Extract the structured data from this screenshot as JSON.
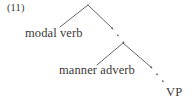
{
  "figure": {
    "example_number": "(11)",
    "kind": "syntax-tree",
    "background_color": "#ffffff",
    "ink_color": "#3a3a38"
  },
  "nodes": [
    {
      "id": "modal-verb",
      "label": "modal verb"
    },
    {
      "id": "manner-adverb",
      "label": "manner adverb"
    },
    {
      "id": "vp",
      "label": "VP"
    }
  ],
  "branches": [
    {
      "id": "upper-left",
      "from": [
        88,
        5
      ],
      "to": [
        60,
        27
      ],
      "style": "solid"
    },
    {
      "id": "upper-right",
      "from": [
        88,
        5
      ],
      "to": [
        113,
        29
      ],
      "style": "solid"
    },
    {
      "id": "upper-right-continuation",
      "from": [
        113,
        29
      ],
      "to": [
        123,
        42
      ],
      "style": "dotted"
    },
    {
      "id": "lower-left",
      "from": [
        123,
        43
      ],
      "to": [
        97,
        65
      ],
      "style": "solid"
    },
    {
      "id": "lower-right",
      "from": [
        123,
        43
      ],
      "to": [
        152,
        68
      ],
      "style": "solid"
    },
    {
      "id": "lower-right-continuation",
      "from": [
        152,
        68
      ],
      "to": [
        165,
        84
      ],
      "style": "dotted"
    }
  ]
}
